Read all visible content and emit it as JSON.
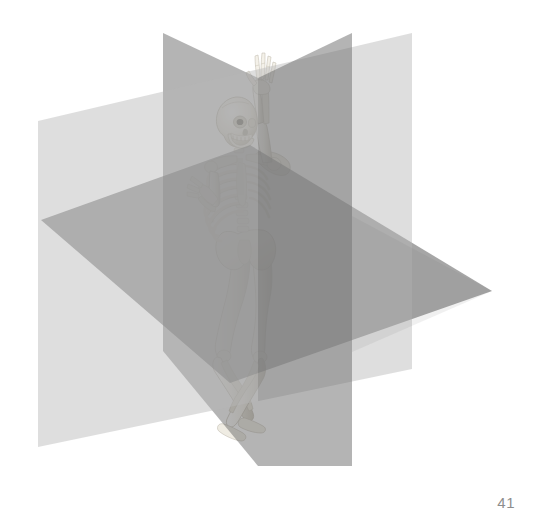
{
  "page": {
    "number": "41",
    "background_color": "#ffffff",
    "width": 533,
    "height": 524
  },
  "figure": {
    "name": "anatomical-planes-skeleton",
    "bone_color": "#f2efe8",
    "bone_shadow_color": "#b9b4a8",
    "planes": [
      {
        "id": "transverse-plane",
        "label": "Transverse plane",
        "color": "#6f6f6f",
        "opacity": 0.62,
        "orientation": "horizontal",
        "points": "41,220 250,145 492,291 230,383"
      },
      {
        "id": "sagittal-plane",
        "label": "Sagittal plane",
        "color": "#6a6a6a",
        "opacity": 0.52,
        "orientation": "vertical-depth",
        "points": "163,33 258,78 258,466 163,351"
      },
      {
        "id": "coronal-plane",
        "label": "Coronal plane",
        "color": "#b5b5b5",
        "opacity": 0.42,
        "orientation": "vertical-width",
        "points": "38,121 412,33 412,369 38,447"
      }
    ],
    "tones": {
      "lightest": "#eaeaea",
      "light": "#d4d4d4",
      "mid": "#9a9a9a",
      "mid_dark": "#7d7d7d",
      "dark": "#5e5e5e",
      "darkest": "#3a3a3a"
    },
    "skeleton": {
      "id": "human-skeleton",
      "pose": "standing, right arm raised overhead, legs crossed",
      "parts": [
        "skull",
        "mandible",
        "cervical-spine",
        "clavicle",
        "scapula",
        "ribcage",
        "sternum",
        "lumbar-spine",
        "pelvis",
        "humerus",
        "radius",
        "ulna",
        "hand",
        "femur",
        "tibia",
        "fibula",
        "foot"
      ]
    }
  }
}
